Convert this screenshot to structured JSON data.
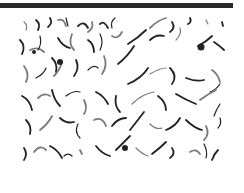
{
  "image": {
    "description": "Grayscale micrograph of dark curvy filaments on white background",
    "colors": {
      "bar": "#2a2a2a",
      "filament": "#222222",
      "filament_light": "#7a7a7a",
      "background": "#ffffff"
    },
    "bar": {
      "x": 0,
      "y": 3,
      "width": 233,
      "height": 5
    },
    "region": {
      "x": 15,
      "y": 12,
      "width": 218,
      "height": 153
    },
    "filaments": [
      "M24 22 q4 3 2 8",
      "M36 20 q5 4 2 10",
      "M50 18 q3 5 -2 9",
      "M58 20 q6 -2 8 6",
      "M66 18 l2 8",
      "M78 26 q6 -6 10 2",
      "M92 22 q2 6 -4 10",
      "M100 24 q4 -4 8 4",
      "M112 28 q-2 -6 3 -10",
      "M150 28 q8 -8 16 -10",
      "M172 22 q4 6 -2 10",
      "M190 18 q2 4 -2 6",
      "M206 20 l2 4",
      "M222 22 l1 4",
      "M20 40 q6 6 2 14",
      "M30 50 q8 -4 14 2",
      "M40 36 q2 8 -2 14",
      "M58 38 q4 8 12 10",
      "M72 34 q-4 10 2 16",
      "M88 40 q6 4 6 12",
      "M100 34 q4 8 0 16",
      "M112 36 q6 4 10 -4",
      "M128 44 q10 -6 18 -14",
      "M150 40 q6 -6 14 -4",
      "M176 40 q6 -6 4 -12",
      "M198 46 q8 -4 14 -10",
      "M214 42 q6 4 10 8",
      "M24 66 q6 8 2 16",
      "M36 78 q8 -4 10 -10",
      "M52 58 q6 6 4 14",
      "M62 62 q-2 8 -8 14",
      "M76 60 q4 8 -2 16",
      "M88 70 q6 -6 10 -2",
      "M104 56 q4 10 -2 18",
      "M118 64 q10 -8 16 -18",
      "M128 84 q14 -6 20 -16",
      "M150 74 q10 -6 16 -6",
      "M170 68 q8 8 2 16",
      "M186 78 q10 4 18 2",
      "M212 70 q6 4 8 12",
      "M220 84 q-4 6 -10 8",
      "M22 96 q8 4 10 14",
      "M38 98 q6 -6 12 -2",
      "M52 90 q2 10 8 16",
      "M66 96 q8 -6 14 -4",
      "M84 100 q4 8 0 14",
      "M96 92 q8 4 12 12",
      "M116 96 q-2 10 4 16",
      "M132 104 q10 -10 22 -12",
      "M158 96 q8 6 8 14",
      "M176 94 q10 6 20 10",
      "M200 100 q8 -6 16 -10",
      "M220 104 q-4 6 -6 12",
      "M26 120 q6 6 4 14",
      "M40 130 q8 -6 12 -14",
      "M60 118 q6 6 14 4",
      "M78 124 q-4 8 2 14",
      "M94 120 q8 -4 12 6",
      "M112 126 q6 -8 14 -8",
      "M130 130 q8 -10 14 -18",
      "M150 124 q6 6 12 4",
      "M166 130 q10 -4 14 -12",
      "M186 120 q8 8 16 10",
      "M206 126 q4 8 -2 14",
      "M220 118 q2 6 -2 10",
      "M24 148 q4 6 0 12",
      "M34 152 q6 -8 12 -2",
      "M50 146 q8 4 12 12",
      "M64 156 q4 -4 8 0",
      "M80 150 l2 4",
      "M96 146 q6 8 14 10",
      "M116 150 q8 -8 14 -14",
      "M136 148 q6 6 12 8",
      "M152 154 q8 -6 14 -12",
      "M172 148 q4 6 -2 10",
      "M190 152 q6 -4 10 2",
      "M204 144 q4 8 2 14",
      "M218 150 q-4 4 -6 10"
    ],
    "blobs": [
      {
        "cx": 60,
        "cy": 62,
        "r": 3
      },
      {
        "cx": 201,
        "cy": 47,
        "r": 3.5
      },
      {
        "cx": 125,
        "cy": 148,
        "r": 3
      },
      {
        "cx": 34,
        "cy": 52,
        "r": 2
      }
    ]
  }
}
